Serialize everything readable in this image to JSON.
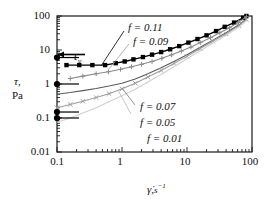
{
  "chart_data": {
    "type": "line",
    "title": "",
    "xlabel": "γ̇, s⁻¹",
    "ylabel": "τ, Pa",
    "xscale": "log",
    "yscale": "log",
    "xlim": [
      0.1,
      100
    ],
    "ylim": [
      0.01,
      100
    ],
    "xticks": [
      "0.1",
      "1",
      "10",
      "100"
    ],
    "yticks": [
      "0.01",
      "0.1",
      "1",
      "10",
      "100"
    ],
    "grid": false,
    "legend_position": "inline-annotations",
    "annotations": [
      {
        "name": "yield-stress-annotation",
        "text": "τ",
        "subscript": "y",
        "x": 0.22,
        "y": 20
      }
    ],
    "series": [
      {
        "name": "f = 0.11",
        "label": "f = 0.11",
        "color": "#000000",
        "marker": "filled-square",
        "yield_stress": 6.0,
        "x": [
          0.14,
          0.22,
          0.35,
          0.55,
          0.8,
          1.1,
          1.5,
          2.1,
          2.9,
          4.0,
          5.5,
          7.6,
          10.5,
          14.5,
          20,
          28,
          38,
          53,
          73,
          82
        ],
        "y": [
          3.6,
          3.6,
          3.6,
          3.6,
          4.1,
          4.6,
          5.3,
          6.2,
          7.3,
          8.7,
          10.5,
          13,
          16.5,
          21,
          27,
          36,
          48,
          64,
          88,
          100
        ]
      },
      {
        "name": "f = 0.09",
        "label": "f = 0.09",
        "color": "#8a8a8a",
        "marker": "plus",
        "yield_stress": 1.0,
        "x": [
          0.16,
          0.25,
          0.4,
          0.62,
          0.95,
          1.4,
          2.0,
          2.9,
          4.1,
          5.8,
          8.2,
          11.5,
          16,
          23,
          32,
          45,
          62,
          82
        ],
        "y": [
          1.45,
          1.7,
          2.0,
          2.3,
          2.7,
          3.2,
          3.8,
          4.6,
          5.7,
          7.2,
          9.3,
          12.2,
          16.5,
          23,
          32,
          45,
          65,
          95
        ]
      },
      {
        "name": "f = 0.07",
        "label": "f = 0.07",
        "color": "#5a5a5a",
        "marker": "none",
        "yield_stress": 0.15,
        "x": [
          0.1,
          0.16,
          0.25,
          0.4,
          0.63,
          1.0,
          1.6,
          2.5,
          4.0,
          6.3,
          10,
          16,
          25,
          40,
          63,
          82
        ],
        "y": [
          0.5,
          0.56,
          0.64,
          0.74,
          0.87,
          1.05,
          1.4,
          2.0,
          3.0,
          4.6,
          7.3,
          12,
          19.5,
          32,
          55,
          82
        ]
      },
      {
        "name": "f = 0.05",
        "label": "f = 0.05",
        "color": "#9e9e9e",
        "marker": "x",
        "yield_stress": 0.1,
        "x": [
          0.1,
          0.16,
          0.25,
          0.4,
          0.63,
          1.0,
          1.6,
          2.5,
          4.0,
          6.3,
          10,
          16,
          25,
          40,
          63,
          82
        ],
        "y": [
          0.2,
          0.25,
          0.31,
          0.4,
          0.52,
          0.72,
          1.05,
          1.6,
          2.5,
          4.0,
          6.5,
          11,
          18,
          30,
          52,
          78
        ]
      },
      {
        "name": "f = 0.01",
        "label": "f = 0.01",
        "color": "#d0d0d0",
        "marker": "none",
        "yield_stress": null,
        "x": [
          0.1,
          0.16,
          0.25,
          0.4,
          0.63,
          1.0,
          1.6,
          2.5,
          4.0,
          6.3,
          10,
          16,
          25,
          40,
          63,
          82
        ],
        "y": [
          0.075,
          0.1,
          0.14,
          0.2,
          0.3,
          0.45,
          0.7,
          1.15,
          1.9,
          3.2,
          5.5,
          9.5,
          16,
          27,
          47,
          72
        ]
      }
    ],
    "yield_markers": [
      {
        "name": "yield-marker-f011",
        "value": 6.0,
        "color": "#000000"
      },
      {
        "name": "yield-marker-f009",
        "value": 1.0,
        "color": "#000000"
      },
      {
        "name": "yield-marker-f007",
        "value": 0.15,
        "color": "#000000"
      },
      {
        "name": "yield-marker-f005",
        "value": 0.1,
        "color": "#000000"
      }
    ],
    "series_labels": [
      {
        "name": "series-label-f011",
        "text": "f = 0.11"
      },
      {
        "name": "series-label-f009",
        "text": "f = 0.09"
      },
      {
        "name": "series-label-f007",
        "text": "f = 0.07"
      },
      {
        "name": "series-label-f005",
        "text": "f = 0.05"
      },
      {
        "name": "series-label-f001",
        "text": "f = 0.01"
      }
    ]
  },
  "axes": {
    "y_label_line1": "τ,",
    "y_label_line2": "Pa",
    "x_label_symbol": "γ̇,",
    "x_label_units_base": "s",
    "x_label_units_exp": "−1",
    "ytick_100": "100",
    "ytick_10": "10",
    "ytick_1": "1",
    "ytick_01": "0.1",
    "ytick_001": "0.01",
    "xtick_01": "0.1",
    "xtick_1": "1",
    "xtick_10": "10",
    "xtick_100": "100"
  },
  "labels": {
    "tau_y_base": "τ",
    "tau_y_sub": "y",
    "f011": "f = 0.11",
    "f009": "f = 0.09",
    "f007": "f = 0.07",
    "f005": "f = 0.05",
    "f001": "f = 0.01"
  }
}
